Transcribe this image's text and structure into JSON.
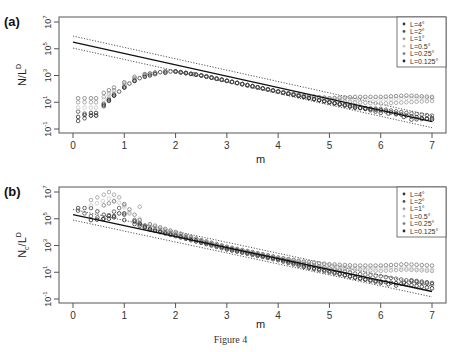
{
  "figure": {
    "caption": "Figure 4"
  },
  "chart_data": [
    {
      "type": "scatter",
      "panel_label": "(a)",
      "title": "",
      "xlabel": "m",
      "ylabel": "N/L^D",
      "ylabel_main": "N/L",
      "ylabel_sup": "D",
      "yscale": "log",
      "xlim": [
        -0.2,
        7.3
      ],
      "ylim_log10": [
        -1,
        7
      ],
      "x_ticks": [
        0,
        1,
        2,
        3,
        4,
        5,
        6,
        7
      ],
      "y_ticks": [
        {
          "base": "10",
          "exp": "7",
          "log": 7
        },
        {
          "base": "10",
          "exp": "5",
          "log": 5
        },
        {
          "base": "10",
          "exp": "3",
          "log": 3
        },
        {
          "base": "10",
          "exp": "1",
          "log": 1
        },
        {
          "base": "10",
          "exp": "-1",
          "log": -1
        }
      ],
      "grid": false,
      "legend_position": "top-right",
      "fit_line": {
        "style": "solid",
        "intercept_log10": 5.5,
        "slope_log10_per_m": -0.85,
        "x_range": [
          0,
          7
        ]
      },
      "confidence_band": {
        "style": "dotted",
        "offset_log10": 0.45
      },
      "series": [
        {
          "name": "L=4°",
          "color": "#3a3a3a",
          "x": [
            0.1,
            0.35,
            0.45,
            0.6,
            0.7,
            0.8,
            0.9,
            1.0,
            1.1,
            1.2,
            1.3,
            1.4,
            1.5,
            1.6,
            1.7,
            1.8,
            1.9,
            2.0,
            2.2,
            2.5,
            3.0,
            3.5,
            4.0,
            4.5,
            5.0,
            5.5,
            6.0,
            6.3,
            6.6,
            7.0
          ],
          "log10_y": [
            -0.4,
            0.0,
            0.0,
            0.7,
            1.1,
            1.5,
            1.8,
            2.1,
            2.4,
            2.6,
            2.8,
            3.0,
            3.1,
            3.2,
            3.25,
            3.3,
            3.3,
            3.3,
            3.2,
            3.0,
            2.6,
            2.2,
            1.8,
            1.4,
            1.0,
            0.7,
            0.2,
            0.1,
            -0.3,
            -0.2
          ]
        },
        {
          "name": "L=2°",
          "color": "#505050",
          "x": [
            0.1,
            0.35,
            0.45,
            0.6,
            0.8,
            1.0,
            1.2,
            1.4,
            1.6,
            1.8,
            2.0,
            2.5,
            3.0,
            3.5,
            4.0,
            4.5,
            5.0,
            5.5,
            6.0,
            6.5,
            7.0
          ],
          "log10_y": [
            0.3,
            0.0,
            0.0,
            0.9,
            1.6,
            2.2,
            2.7,
            3.0,
            3.2,
            3.3,
            3.3,
            3.0,
            2.6,
            2.2,
            1.8,
            1.4,
            1.0,
            0.6,
            0.5,
            0.2,
            0.0
          ]
        },
        {
          "name": "L=1°",
          "color": "#9a9a9a",
          "x": [
            0.1,
            0.35,
            0.45,
            0.6,
            0.8,
            1.0,
            1.2,
            1.4,
            1.6,
            1.8,
            2.0,
            2.5,
            3.0,
            3.5,
            4.0,
            4.5,
            5.0,
            5.5,
            6.0,
            6.5,
            7.0
          ],
          "log10_y": [
            1.0,
            1.0,
            1.0,
            1.4,
            1.9,
            2.4,
            2.8,
            3.1,
            3.2,
            3.3,
            3.3,
            3.0,
            2.6,
            2.2,
            1.8,
            1.5,
            1.2,
            1.0,
            0.9,
            1.0,
            1.1
          ]
        },
        {
          "name": "L=0.5°",
          "color": "#c8c8c8",
          "x": [
            0.1,
            0.35,
            0.45,
            0.6,
            0.8,
            1.0,
            1.2,
            1.4,
            1.6,
            1.8,
            2.0,
            2.5,
            3.0,
            3.5,
            4.0,
            4.5,
            5.0,
            5.5,
            6.0,
            6.5,
            7.0
          ],
          "log10_y": [
            0.6,
            0.6,
            0.6,
            1.2,
            1.8,
            2.3,
            2.7,
            3.0,
            3.2,
            3.3,
            3.3,
            3.0,
            2.6,
            2.2,
            1.8,
            1.5,
            1.3,
            1.2,
            1.2,
            1.3,
            1.3
          ]
        },
        {
          "name": "L=0.25°",
          "color": "#7a7a7a",
          "x": [
            0.1,
            0.35,
            0.45,
            0.6,
            0.8,
            1.0,
            1.2,
            1.4,
            1.6,
            1.8,
            2.0,
            2.5,
            3.0,
            3.5,
            4.0,
            4.5,
            5.0,
            5.5,
            6.0,
            6.5,
            7.0
          ],
          "log10_y": [
            1.3,
            1.3,
            1.3,
            1.7,
            2.1,
            2.5,
            2.9,
            3.1,
            3.2,
            3.3,
            3.3,
            3.0,
            2.6,
            2.2,
            1.8,
            1.5,
            1.3,
            1.4,
            1.4,
            1.5,
            1.4
          ]
        },
        {
          "name": "L=0.125°",
          "color": "#2a2a2a",
          "x": [
            0.1,
            0.35,
            0.45,
            0.6,
            0.8,
            1.0,
            1.2,
            1.4,
            1.6,
            1.8,
            2.0,
            2.5,
            3.0,
            3.5,
            4.0,
            4.5,
            5.0,
            5.5,
            6.0,
            6.5,
            7.0
          ],
          "log10_y": [
            -0.1,
            0.2,
            0.2,
            0.8,
            1.5,
            2.1,
            2.6,
            2.9,
            3.1,
            3.2,
            3.3,
            3.0,
            2.6,
            2.2,
            1.8,
            1.4,
            1.0,
            0.6,
            0.4,
            0.0,
            -0.3
          ]
        }
      ]
    },
    {
      "type": "scatter",
      "panel_label": "(b)",
      "title": "",
      "xlabel": "m",
      "ylabel": "N_c/L^D",
      "ylabel_main": "N",
      "ylabel_sub": "c",
      "ylabel_after": "/L",
      "ylabel_sup": "D",
      "yscale": "log",
      "xlim": [
        -0.2,
        7.3
      ],
      "ylim_log10": [
        -1,
        7
      ],
      "x_ticks": [
        0,
        1,
        2,
        3,
        4,
        5,
        6,
        7
      ],
      "y_ticks": [
        {
          "base": "10",
          "exp": "7",
          "log": 7
        },
        {
          "base": "10",
          "exp": "5",
          "log": 5
        },
        {
          "base": "10",
          "exp": "3",
          "log": 3
        },
        {
          "base": "10",
          "exp": "1",
          "log": 1
        },
        {
          "base": "10",
          "exp": "-1",
          "log": -1
        }
      ],
      "grid": false,
      "legend_position": "top-right",
      "fit_line": {
        "style": "solid",
        "intercept_log10": 5.3,
        "slope_log10_per_m": -0.82,
        "x_range": [
          0,
          7
        ]
      },
      "confidence_band": {
        "style": "dotted",
        "offset_log10": 0.4
      },
      "series": [
        {
          "name": "L=4°",
          "color": "#3a3a3a",
          "x": [
            0.1,
            0.35,
            0.6,
            0.8,
            1.0,
            1.2,
            1.5,
            2.0,
            2.5,
            3.0,
            3.5,
            4.0,
            4.5,
            5.0,
            5.5,
            6.0,
            6.3,
            6.6,
            7.0
          ],
          "log10_y": [
            5.8,
            5.8,
            5.3,
            5.1,
            4.9,
            4.6,
            4.2,
            3.8,
            3.3,
            2.8,
            2.4,
            2.0,
            1.5,
            1.1,
            0.6,
            0.2,
            0.0,
            0.4,
            0.2
          ]
        },
        {
          "name": "L=2°",
          "color": "#505050",
          "x": [
            0.1,
            0.35,
            0.6,
            0.9,
            1.0,
            1.2,
            1.5,
            2.0,
            2.5,
            3.0,
            3.5,
            4.0,
            4.5,
            5.0,
            5.5,
            6.0,
            6.5,
            7.0
          ],
          "log10_y": [
            5.6,
            5.2,
            5.0,
            5.8,
            5.3,
            4.9,
            4.3,
            3.8,
            3.3,
            2.8,
            2.4,
            2.0,
            1.6,
            1.3,
            0.9,
            0.7,
            0.4,
            0.1
          ]
        },
        {
          "name": "L=1°",
          "color": "#9a9a9a",
          "x": [
            0.35,
            0.6,
            0.7,
            0.9,
            1.1,
            1.3,
            1.5,
            2.0,
            2.5,
            3.0,
            3.5,
            4.0,
            4.5,
            5.0,
            5.5,
            6.0,
            6.5,
            7.0
          ],
          "log10_y": [
            6.4,
            6.8,
            7.0,
            6.6,
            5.4,
            5.9,
            4.4,
            3.9,
            3.4,
            2.9,
            2.5,
            2.1,
            1.7,
            1.3,
            1.2,
            1.1,
            1.2,
            1.1
          ]
        },
        {
          "name": "L=0.5°",
          "color": "#c8c8c8",
          "x": [
            0.35,
            0.7,
            0.9,
            1.1,
            1.3,
            1.5,
            2.0,
            2.5,
            3.0,
            3.5,
            4.0,
            4.5,
            5.0,
            5.5,
            6.0,
            6.5,
            7.0
          ],
          "log10_y": [
            6.0,
            6.5,
            6.2,
            5.5,
            5.0,
            4.5,
            3.9,
            3.4,
            2.9,
            2.5,
            2.1,
            1.8,
            1.5,
            1.3,
            1.3,
            1.3,
            1.2
          ]
        },
        {
          "name": "L=0.25°",
          "color": "#7a7a7a",
          "x": [
            0.6,
            0.8,
            1.0,
            1.3,
            1.5,
            2.0,
            2.5,
            3.0,
            3.5,
            4.0,
            4.5,
            5.0,
            5.5,
            6.0,
            6.5,
            7.0
          ],
          "log10_y": [
            6.0,
            6.3,
            6.1,
            4.9,
            4.6,
            4.0,
            3.4,
            2.9,
            2.5,
            2.1,
            1.8,
            1.6,
            1.5,
            1.5,
            1.6,
            1.5
          ]
        },
        {
          "name": "L=0.125°",
          "color": "#2a2a2a",
          "x": [
            0.35,
            0.7,
            0.9,
            1.0,
            1.2,
            1.5,
            2.0,
            2.5,
            3.0,
            3.5,
            4.0,
            4.5,
            5.0,
            5.5,
            6.0,
            6.5,
            7.0
          ],
          "log10_y": [
            4.9,
            5.0,
            5.4,
            5.4,
            4.8,
            4.2,
            3.7,
            3.2,
            2.7,
            2.3,
            1.9,
            1.4,
            1.0,
            0.6,
            0.3,
            0.1,
            -0.2
          ]
        }
      ]
    }
  ],
  "legend": {
    "items": [
      {
        "label": "L=4°",
        "color": "#3a3a3a"
      },
      {
        "label": "L=2°",
        "color": "#505050"
      },
      {
        "label": "L=1°",
        "color": "#9a9a9a"
      },
      {
        "label": "L=0.5°",
        "color": "#c8c8c8"
      },
      {
        "label": "L=0.25°",
        "color": "#7a7a7a"
      },
      {
        "label": "L=0.125°",
        "color": "#2a2a2a"
      }
    ]
  }
}
